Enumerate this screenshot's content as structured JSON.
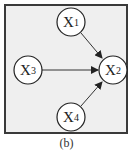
{
  "diagram": {
    "type": "directed-graph",
    "caption": "(b)",
    "nodes": [
      {
        "id": "X1",
        "base": "X",
        "sub": "1",
        "cx": 71,
        "cy": 22
      },
      {
        "id": "X2",
        "base": "X",
        "sub": "2",
        "cx": 113,
        "cy": 70
      },
      {
        "id": "X3",
        "base": "X",
        "sub": "3",
        "cx": 28,
        "cy": 70
      },
      {
        "id": "X4",
        "base": "X",
        "sub": "4",
        "cx": 71,
        "cy": 117
      }
    ],
    "edges": [
      {
        "from": "X1",
        "to": "X2"
      },
      {
        "from": "X3",
        "to": "X2"
      },
      {
        "from": "X4",
        "to": "X2"
      }
    ],
    "colors": {
      "background": "#efefef",
      "border": "#3a3a3a",
      "node_fill": "#ffffff",
      "edge": "#333333"
    }
  }
}
